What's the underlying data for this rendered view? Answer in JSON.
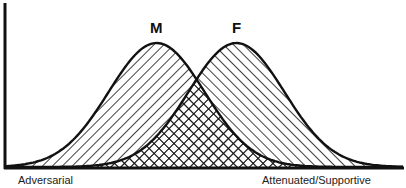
{
  "chart_data": {
    "type": "area",
    "title": "",
    "xlabel": "",
    "ylabel": "",
    "x_axis_endpoints": {
      "left": "Adversarial",
      "right": "Attenuated/Supportive"
    },
    "grid": false,
    "legend": "none (series labeled directly above peaks)",
    "x": [
      0,
      0.1,
      0.2,
      0.3,
      0.4,
      0.5,
      0.6,
      0.7,
      0.8,
      0.9,
      1.0
    ],
    "series": [
      {
        "name": "M",
        "shape": "normal distribution",
        "peak_x": 0.38,
        "sigma": 0.12,
        "fill_pattern": "diagonal hatch (\\\\)",
        "values": [
          0.01,
          0.04,
          0.18,
          0.54,
          0.98,
          0.83,
          0.35,
          0.07,
          0.01,
          0.0,
          0.0
        ]
      },
      {
        "name": "F",
        "shape": "normal distribution",
        "peak_x": 0.58,
        "sigma": 0.12,
        "fill_pattern": "diagonal hatch (//)",
        "values": [
          0.0,
          0.0,
          0.01,
          0.07,
          0.29,
          0.78,
          0.98,
          0.6,
          0.2,
          0.04,
          0.0
        ]
      }
    ],
    "overlap_fill_pattern": "crosshatch",
    "ylim": [
      0,
      1.05
    ]
  },
  "labels": {
    "m": "M",
    "f": "F",
    "left": "Adversarial",
    "right": "Attenuated/Supportive"
  },
  "colors": {
    "ink": "#111111",
    "background": "#ffffff"
  }
}
